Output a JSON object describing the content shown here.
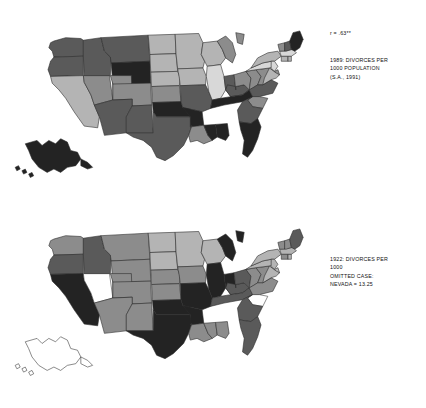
{
  "figure": {
    "background_color": "#ffffff",
    "panels": [
      {
        "id": "1989",
        "correlation_label": "r = .63**",
        "caption_lines": [
          "1989: DIVORCES PER",
          "1000 POPULATION",
          "(S.A., 1991)"
        ]
      },
      {
        "id": "1922",
        "correlation_label": "",
        "caption_lines": [
          "1922: DIVORCES PER",
          "1000",
          "OMITTED CASE:",
          "NEVADA = 13.25"
        ]
      }
    ]
  },
  "shade_palette": {
    "level_1_lightest": "#d8d8d8",
    "level_2_light": "#b4b4b4",
    "level_3_medium": "#8c8c8c",
    "level_4_dark": "#5a5a5a",
    "level_5_darkest": "#232323",
    "omitted_white": "#ffffff"
  },
  "chart_data": {
    "type": "heatmap",
    "subtitle": "Two-panel choropleth comparison",
    "xlabel": "",
    "ylabel": "",
    "legend_position": "none",
    "grid": false,
    "notes": [
      "r = .63** correlation between the 1989 and 1922 state divorce rates",
      "Nevada omitted from the 1922 map as an outlier at 13.25 divorces per 1000",
      "Alaska and Hawaii are unshaded on the 1922 map (not yet states)"
    ],
    "shade_scale": {
      "description": "Five-step gray scale; darker gray indicates a higher divorce rate",
      "levels": [
        1,
        2,
        3,
        4,
        5
      ],
      "colors": [
        "#d8d8d8",
        "#b4b4b4",
        "#8c8c8c",
        "#5a5a5a",
        "#232323"
      ]
    },
    "series": [
      {
        "name": "1989: DIVORCES PER 1000 POPULATION (S.A., 1991)",
        "panel": "1989",
        "values": {
          "WA": 4,
          "OR": 4,
          "CA": 2,
          "NV": 3,
          "ID": 4,
          "MT": 4,
          "WY": 5,
          "UT": 3,
          "AZ": 4,
          "CO": 3,
          "NM": 4,
          "ND": 2,
          "SD": 2,
          "NE": 2,
          "KS": 3,
          "OK": 5,
          "TX": 4,
          "MN": 2,
          "IA": 2,
          "MO": 4,
          "AR": 5,
          "LA": 3,
          "WI": 2,
          "IL": 1,
          "MS": 5,
          "AL": 5,
          "MI": 3,
          "IN": 4,
          "KY": 4,
          "TN": 5,
          "OH": 3,
          "WV": 3,
          "VA": 3,
          "NC": 4,
          "SC": 3,
          "GA": 4,
          "FL": 5,
          "PA": 1,
          "NY": 2,
          "NJ": 1,
          "DE": 3,
          "MD": 2,
          "CT": 2,
          "RI": 2,
          "MA": 1,
          "VT": 3,
          "NH": 4,
          "ME": 5,
          "AK": 5,
          "HI": 5
        }
      },
      {
        "name": "1922: DIVORCES PER 1000",
        "panel": "1922",
        "values": {
          "WA": 3,
          "OR": 4,
          "CA": 5,
          "NV": 0,
          "ID": 4,
          "MT": 3,
          "WY": 3,
          "UT": 3,
          "AZ": 3,
          "CO": 3,
          "NM": 3,
          "ND": 2,
          "SD": 2,
          "NE": 3,
          "KS": 3,
          "OK": 5,
          "TX": 5,
          "MN": 2,
          "IA": 3,
          "MO": 5,
          "AR": 5,
          "LA": 3,
          "WI": 2,
          "IL": 5,
          "MS": 3,
          "AL": 3,
          "MI": 5,
          "IN": 5,
          "KY": 4,
          "TN": 4,
          "OH": 4,
          "WV": 3,
          "VA": 3,
          "NC": 3,
          "SC": 0,
          "GA": 4,
          "FL": 4,
          "PA": 2,
          "NY": 2,
          "NJ": 2,
          "DE": 2,
          "MD": 2,
          "CT": 3,
          "RI": 2,
          "MA": 2,
          "VT": 3,
          "NH": 3,
          "ME": 4,
          "AK": 0,
          "HI": 0
        }
      }
    ]
  },
  "geometry": {
    "states": {
      "WA": "M64,28 L78,24 L96,25 L99,27 L99,46 L64,47 L62,40 L58,36 L60,30 Z",
      "OR": "M64,47 L99,46 L99,69 L60,70 L57,62 L60,52 Z",
      "CA": "M60,70 L99,69 L100,77 L108,92 L112,104 L118,118 L116,131 L100,129 L88,112 L78,96 L70,86 L62,78 Z",
      "NV": "M99,69 L100,77 L108,92 L112,104 L134,98 L130,69 Z",
      "ID": "M99,27 L120,24 L124,40 L132,47 L131,69 L100,69 L99,46 Z",
      "MT": "M120,24 L176,21 L178,52 L132,54 L131,47 L124,40 Z",
      "WY": "M132,54 L178,52 L179,78 L134,79 Z",
      "UT": "M131,69 L134,79 L134,98 L157,97 L156,69 Z",
      "CO": "M134,79 L179,78 L180,104 L157,105 L157,97 L134,98 Z",
      "AZ": "M112,104 L118,118 L124,140 L150,137 L150,118 L157,105 L157,97 L134,98 Z",
      "NM": "M157,105 L180,104 L182,137 L150,137 L150,118 Z",
      "ND": "M176,21 L208,20 L209,43 L178,44 Z",
      "SD": "M178,44 L209,43 L211,64 L179,65 Z",
      "NE": "M179,65 L211,64 L214,72 L213,81 L180,82 Z",
      "KS": "M180,82 L213,81 L215,100 L181,101 Z",
      "OK": "M181,101 L215,100 L217,107 L226,108 L226,118 L186,118 L182,112 Z",
      "TX": "M182,112 L186,118 L226,118 L228,128 L224,140 L218,152 L206,164 L196,170 L186,166 L180,154 L170,146 L158,142 L150,137 L182,137 Z",
      "MN": "M208,20 L236,19 L241,30 L239,44 L243,52 L241,60 L211,61 L209,43 Z",
      "IA": "M211,61 L241,60 L245,70 L244,80 L214,81 L213,72 Z",
      "MO": "M214,81 L244,80 L248,88 L252,98 L250,108 L240,112 L217,107 L215,100 Z",
      "AR": "M217,107 L240,112 L242,128 L226,130 L226,118 Z",
      "LA": "M226,130 L242,128 L247,140 L252,146 L242,150 L234,146 L226,148 L224,140 L228,128 Z",
      "WI": "M241,30 L258,28 L264,38 L268,48 L262,56 L246,58 L243,52 L239,44 Z",
      "IL": "M246,58 L262,56 L266,70 L268,86 L262,96 L252,98 L248,88 L245,70 Z",
      "MS": "M242,128 L256,127 L258,142 L252,146 L247,140 Z",
      "AL": "M256,127 L270,126 L272,140 L268,146 L258,142 Z",
      "MI": "M258,28 L268,22 L276,30 L280,44 L276,54 L268,48 L264,38 Z M280,18 L290,20 L288,32 L282,30 Z",
      "IN": "M266,70 L278,68 L280,86 L274,94 L268,86 Z",
      "KY": "M268,86 L274,94 L288,92 L296,86 L290,80 L280,82 L270,80 Z",
      "TN": "M252,98 L262,96 L274,94 L288,92 L296,86 L300,94 L288,100 L266,104 L250,108 Z",
      "OH": "M278,68 L292,64 L298,72 L296,86 L290,80 L280,82 L280,86 Z",
      "WV": "M292,64 L304,62 L310,70 L306,80 L300,84 L296,86 L298,72 Z",
      "VA": "M304,62 L320,60 L328,66 L322,74 L312,80 L306,80 L310,70 Z",
      "NC": "M306,80 L312,80 L322,74 L330,78 L324,90 L308,94 L300,94 L296,86 Z",
      "SC": "M300,94 L308,94 L318,96 L312,108 L300,106 L294,98 Z",
      "GA": "M288,100 L300,94 L294,98 L300,106 L312,108 L306,120 L298,126 L284,124 L282,110 Z",
      "FL": "M284,124 L298,126 L306,120 L310,130 L306,144 L300,158 L294,166 L288,162 L290,146 L286,134 Z",
      "PA": "M292,64 L298,60 L312,54 L322,52 L324,58 L320,60 L304,62 Z",
      "NY": "M298,60 L306,48 L318,42 L330,40 L334,46 L326,52 L322,52 L312,54 Z",
      "NJ": "M322,52 L326,52 L330,58 L326,64 L322,60 Z",
      "DE": "M326,64 L330,62 L332,68 L328,70 Z",
      "MD": "M320,60 L328,66 L332,68 L328,72 L322,74 L312,80 L314,72 Z",
      "CT": "M334,46 L342,46 L342,52 L334,52 Z",
      "RI": "M342,46 L346,46 L346,52 L342,52 Z",
      "MA": "M332,40 L348,38 L352,42 L346,46 L334,46 Z",
      "VT": "M330,32 L338,30 L338,40 L332,40 Z",
      "NH": "M338,30 L344,28 L346,38 L340,40 L338,40 Z",
      "ME": "M344,28 L348,18 L356,16 L360,26 L356,36 L350,40 L346,38 Z",
      "AK": "M30,150 L44,146 L50,152 L58,146 L66,150 L72,144 L80,148 L84,158 L92,160 L96,168 L90,176 L80,178 L72,184 L64,180 L56,184 L46,178 L38,168 L34,158 Z M96,168 L104,172 L110,178 L104,180 L96,176 Z",
      "HI": "M18,178 L22,176 L24,180 L20,182 Z M26,182 L30,180 L32,184 L28,186 Z M34,186 L38,184 L40,188 L36,190 Z"
    },
    "viewbox": "0 0 380 196"
  }
}
